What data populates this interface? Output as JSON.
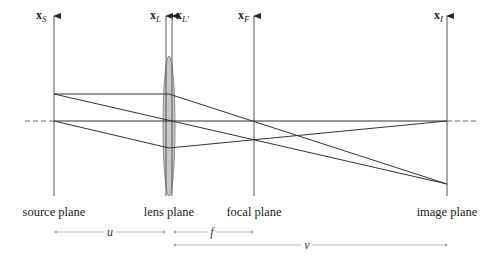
{
  "diagram": {
    "type": "thin-lens ray diagram",
    "planes": [
      {
        "id": "source",
        "axis_symbol": "x",
        "axis_subscript": "S",
        "label": "source plane",
        "x": 54
      },
      {
        "id": "lens",
        "axis_symbol": "x",
        "axis_subscript": "L",
        "label": "lens plane",
        "x": 166
      },
      {
        "id": "lens-prime",
        "axis_symbol": "x",
        "axis_subscript": "L'",
        "label": "",
        "x": 172
      },
      {
        "id": "focal",
        "axis_symbol": "x",
        "axis_subscript": "F",
        "label": "focal plane",
        "x": 254
      },
      {
        "id": "image",
        "axis_symbol": "x",
        "axis_subscript": "I",
        "label": "image plane",
        "x": 447
      }
    ],
    "labels": {
      "source_plane": "source plane",
      "lens_plane": "lens plane",
      "focal_plane": "focal plane",
      "image_plane": "image plane"
    },
    "axis_labels": {
      "source": {
        "main": "x",
        "sub": "S"
      },
      "lens": {
        "main": "x",
        "sub": "L"
      },
      "lens_prime": {
        "main": "x",
        "sub": "L′"
      },
      "focal": {
        "main": "x",
        "sub": "F"
      },
      "image": {
        "main": "x",
        "sub": "I"
      }
    },
    "dimensions": {
      "u": {
        "symbol": "u",
        "from": "source plane",
        "to": "lens plane"
      },
      "f": {
        "symbol": "f",
        "from": "lens plane",
        "to": "focal plane"
      },
      "v": {
        "symbol": "v",
        "from": "lens plane",
        "to": "image plane"
      }
    },
    "colors": {
      "line": "#333333",
      "plane": "#555555",
      "lens_fill": "#c8c8c8",
      "dimension_line": "#aaaaaa"
    }
  }
}
